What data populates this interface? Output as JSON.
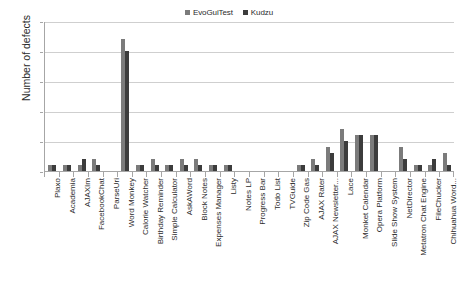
{
  "chart_data": {
    "type": "bar",
    "title": "",
    "xlabel": "",
    "ylabel": "Number of defects",
    "ylim": [
      0,
      25
    ],
    "yticks": [
      0,
      5,
      10,
      15,
      20,
      25
    ],
    "grid": true,
    "legend_position": "top-center",
    "categories": [
      "Plaxo",
      "Academia",
      "AJAXIm",
      "FacebookChat",
      "ParseUri",
      "Word Monkey",
      "Calorie Watcher",
      "Birthday Reminder",
      "Simple Calculator",
      "AskAWord",
      "Block Notes",
      "Expenses Manager",
      "Listy",
      "Notes LP",
      "Progress Bar",
      "Todo List",
      "TVGuide",
      "Zip Code Gas",
      "AJAX Rater",
      "AJAX Newsletter...",
      "Lace",
      "Monket Calendar",
      "Opera Platform",
      "Slide Show System",
      "NetDirector",
      "Metatron Chat Engine",
      "FileChucker",
      "Chihuahua Word..."
    ],
    "series": [
      {
        "name": "EvoGuiTest",
        "color": "#7b7b7b",
        "values": [
          1,
          1,
          1,
          2,
          0,
          22,
          1,
          2,
          1,
          2,
          2,
          1,
          1,
          0,
          0,
          0,
          0,
          1,
          2,
          4,
          7,
          6,
          6,
          0,
          4,
          1,
          1,
          3
        ]
      },
      {
        "name": "Kudzu",
        "color": "#3c3c3c",
        "values": [
          1,
          1,
          2,
          1,
          0,
          20,
          1,
          1,
          1,
          1,
          1,
          1,
          1,
          0,
          0,
          0,
          0,
          1,
          1,
          3,
          5,
          6,
          6,
          0,
          2,
          1,
          2,
          1
        ]
      }
    ]
  }
}
